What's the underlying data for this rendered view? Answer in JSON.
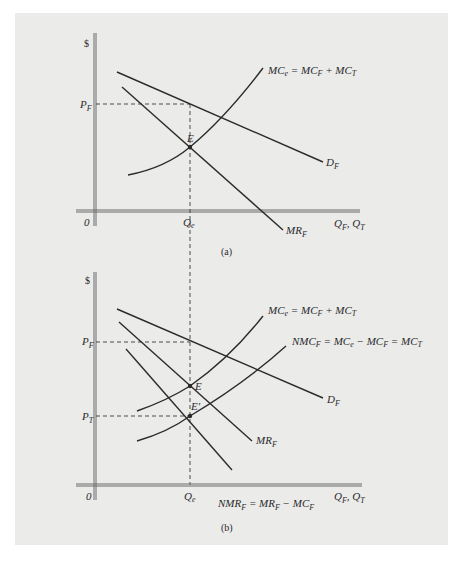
{
  "figure": {
    "panels": [
      {
        "id": "a",
        "caption": "(a)",
        "y_axis_label": "$",
        "x_axis_label": "Q_F, Q_T",
        "origin_label": "0",
        "price_label": "P_F",
        "quantity_label": "Q_e",
        "point_labels": [
          "E"
        ],
        "curves": [
          {
            "name": "D_F",
            "label": "D",
            "sub": "F"
          },
          {
            "name": "MR_F",
            "label": "MR",
            "sub": "F"
          },
          {
            "name": "MC_e",
            "label": "MC_e = MC_F + MC_T"
          }
        ]
      },
      {
        "id": "b",
        "caption": "(b)",
        "y_axis_label": "$",
        "x_axis_label": "Q_F, Q_T",
        "origin_label": "0",
        "price_labels": [
          "P_F",
          "P_T"
        ],
        "quantity_label": "Q_e",
        "point_labels": [
          "E",
          "E'"
        ],
        "curves": [
          {
            "name": "D_F"
          },
          {
            "name": "MR_F"
          },
          {
            "name": "NMR_F",
            "label": "NMR_F = MR_F − MC_F"
          },
          {
            "name": "MC_e",
            "label": "MC_e = MC_F + MC_T"
          },
          {
            "name": "NMC_F",
            "label": "NMC_F = MC_e − MC_F = MC_T"
          }
        ]
      }
    ]
  },
  "text": {
    "dollar": "$",
    "zero": "0",
    "cap_a": "(a)",
    "cap_b": "(b)",
    "P": "P",
    "F": "F",
    "T": "T",
    "Q": "Q",
    "e": "e",
    "E": "E",
    "Eprime": "E′",
    "D": "D",
    "MR": "MR",
    "NMR": "NMR",
    "MC": "MC",
    "NMC": "NMC",
    "eq": " = ",
    "plus": " + ",
    "minus": " − ",
    "comma": ", "
  }
}
